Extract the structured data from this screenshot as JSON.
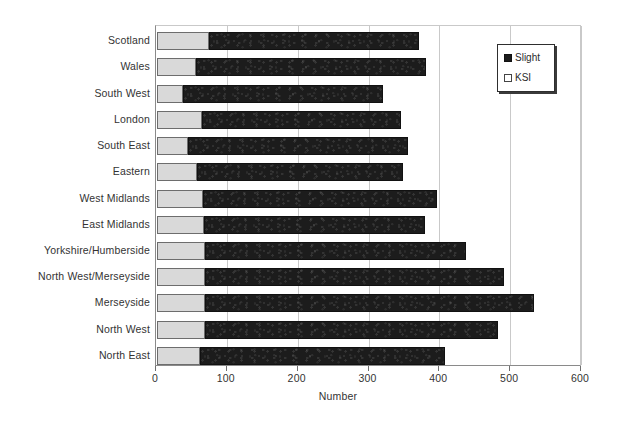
{
  "chart_data": {
    "type": "bar",
    "orientation": "horizontal",
    "stacked": true,
    "title": "",
    "xlabel": "Number",
    "ylabel": "",
    "xlim": [
      0,
      600
    ],
    "xticks": [
      0,
      100,
      200,
      300,
      400,
      500,
      600
    ],
    "grid": true,
    "legend_position": "top-right",
    "categories": [
      "Scotland",
      "Wales",
      "South West",
      "London",
      "South East",
      "Eastern",
      "West Midlands",
      "East Midlands",
      "Yorkshire/Humberside",
      "North West/Merseyside",
      "Merseyside",
      "North West",
      "North East"
    ],
    "series": [
      {
        "name": "KSI",
        "color": "#d9d9d9",
        "values": [
          73,
          55,
          37,
          63,
          44,
          56,
          65,
          67,
          68,
          68,
          68,
          68,
          60
        ]
      },
      {
        "name": "Slight",
        "color": "#1c1c1c",
        "values": [
          297,
          325,
          282,
          282,
          310,
          292,
          330,
          312,
          368,
          422,
          464,
          413,
          347
        ]
      }
    ],
    "totals": [
      370,
      380,
      319,
      345,
      354,
      348,
      395,
      379,
      436,
      490,
      532,
      481,
      407
    ]
  },
  "legend": {
    "items": [
      {
        "label": "Slight",
        "swatch": "dark-square-icon"
      },
      {
        "label": "KSI",
        "swatch": "light-square-icon"
      }
    ]
  }
}
